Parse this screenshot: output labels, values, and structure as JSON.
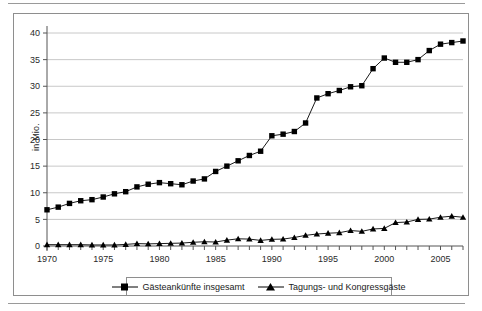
{
  "chart_data": {
    "type": "line",
    "title": "",
    "subtitle": "",
    "xlabel": "",
    "ylabel": "in Mio.",
    "xlim": [
      1970,
      2007
    ],
    "ylim": [
      0,
      40
    ],
    "ytick_step": 5,
    "yticks": [
      0,
      5,
      10,
      15,
      20,
      25,
      30,
      35,
      40
    ],
    "xticks": [
      1970,
      1975,
      1980,
      1985,
      1990,
      1995,
      2000,
      2005
    ],
    "xtick_labels": [
      "1970",
      "1975",
      "1980",
      "1985",
      "1990",
      "1995",
      "2000",
      "2005"
    ],
    "ytick_labels": [
      "0",
      "5",
      "10",
      "15",
      "20",
      "25",
      "30",
      "35",
      "40"
    ],
    "grid": "horizontal",
    "legend_position": "bottom",
    "x": [
      1970,
      1971,
      1972,
      1973,
      1974,
      1975,
      1976,
      1977,
      1978,
      1979,
      1980,
      1981,
      1982,
      1983,
      1984,
      1985,
      1986,
      1987,
      1988,
      1989,
      1990,
      1991,
      1992,
      1993,
      1994,
      1995,
      1996,
      1997,
      1998,
      1999,
      2000,
      2001,
      2002,
      2003,
      2004,
      2005,
      2006,
      2007
    ],
    "series": [
      {
        "name": "Gästeankünfte insgesamt",
        "marker": "square",
        "color": "#000000",
        "values": [
          6.8,
          7.3,
          8.0,
          8.5,
          8.7,
          9.2,
          9.8,
          10.2,
          11.1,
          11.6,
          11.9,
          11.7,
          11.5,
          12.2,
          12.6,
          14.0,
          15.0,
          16.0,
          17.0,
          17.8,
          20.7,
          21.0,
          21.5,
          23.1,
          27.8,
          28.6,
          29.2,
          29.9,
          30.1,
          33.3,
          35.3,
          34.5,
          34.5,
          35.0,
          36.7,
          37.9,
          38.2,
          38.5
        ]
      },
      {
        "name": "Tagungs- und Kongressgäste",
        "marker": "triangle",
        "color": "#000000",
        "values": [
          0.25,
          0.25,
          0.25,
          0.25,
          0.2,
          0.2,
          0.2,
          0.3,
          0.45,
          0.4,
          0.45,
          0.5,
          0.55,
          0.7,
          0.8,
          0.75,
          1.1,
          1.35,
          1.3,
          1.05,
          1.25,
          1.3,
          1.6,
          2.0,
          2.25,
          2.4,
          2.5,
          2.9,
          2.75,
          3.2,
          3.3,
          4.4,
          4.5,
          5.0,
          5.05,
          5.4,
          5.6,
          5.4
        ]
      }
    ],
    "legend": [
      {
        "label": "Gästeankünfte insgesamt",
        "marker": "square"
      },
      {
        "label": "Tagungs- und Kongressgäste",
        "marker": "triangle"
      }
    ]
  },
  "axis": {
    "y_axis_title": "in Mio."
  },
  "colors": {
    "series_line": "#000000",
    "gridline": "#c8c8c8",
    "axis": "#555555",
    "frame": "#8e8e8e",
    "rule": "#9a9a9a"
  }
}
